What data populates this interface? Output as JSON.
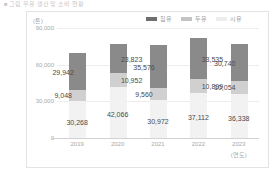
{
  "caption": "■ 그림  우유 생산 및 소비 현황",
  "chart_data": {
    "type": "bar",
    "stacked": true,
    "title": "",
    "subtitle": "",
    "unit_label": "(톤)",
    "xlabel": "(연도)",
    "ylabel": "",
    "categories": [
      "2019",
      "2020",
      "2021",
      "2022",
      "2023"
    ],
    "ylim": [
      0,
      90000
    ],
    "yticks": [
      0,
      30000,
      60000,
      90000
    ],
    "ytick_labels": [
      "0",
      "30,000",
      "60,000",
      "90,000"
    ],
    "grid": true,
    "legend_position": "top-right",
    "series": [
      {
        "name": "집유",
        "color": "#8a8a8a",
        "values": [
          29942,
          23823,
          35576,
          33535,
          30740
        ],
        "labels": [
          "29,942",
          "23,823",
          "35,576",
          "33,535",
          "30,740"
        ]
      },
      {
        "name": "두유",
        "color": "#d0d0d0",
        "values": [
          9048,
          10952,
          9560,
          10899,
          10054
        ],
        "labels": [
          "9,048",
          "10,952",
          "9,560",
          "10,899",
          "10,054"
        ]
      },
      {
        "name": "시유",
        "color": "#f2f2f2",
        "values": [
          30268,
          42066,
          30972,
          37112,
          36338
        ],
        "labels": [
          "30,268",
          "42,066",
          "30,972",
          "37,112",
          "36,338"
        ]
      }
    ],
    "totals": [
      69258,
      76841,
      76108,
      81546,
      77132
    ]
  }
}
